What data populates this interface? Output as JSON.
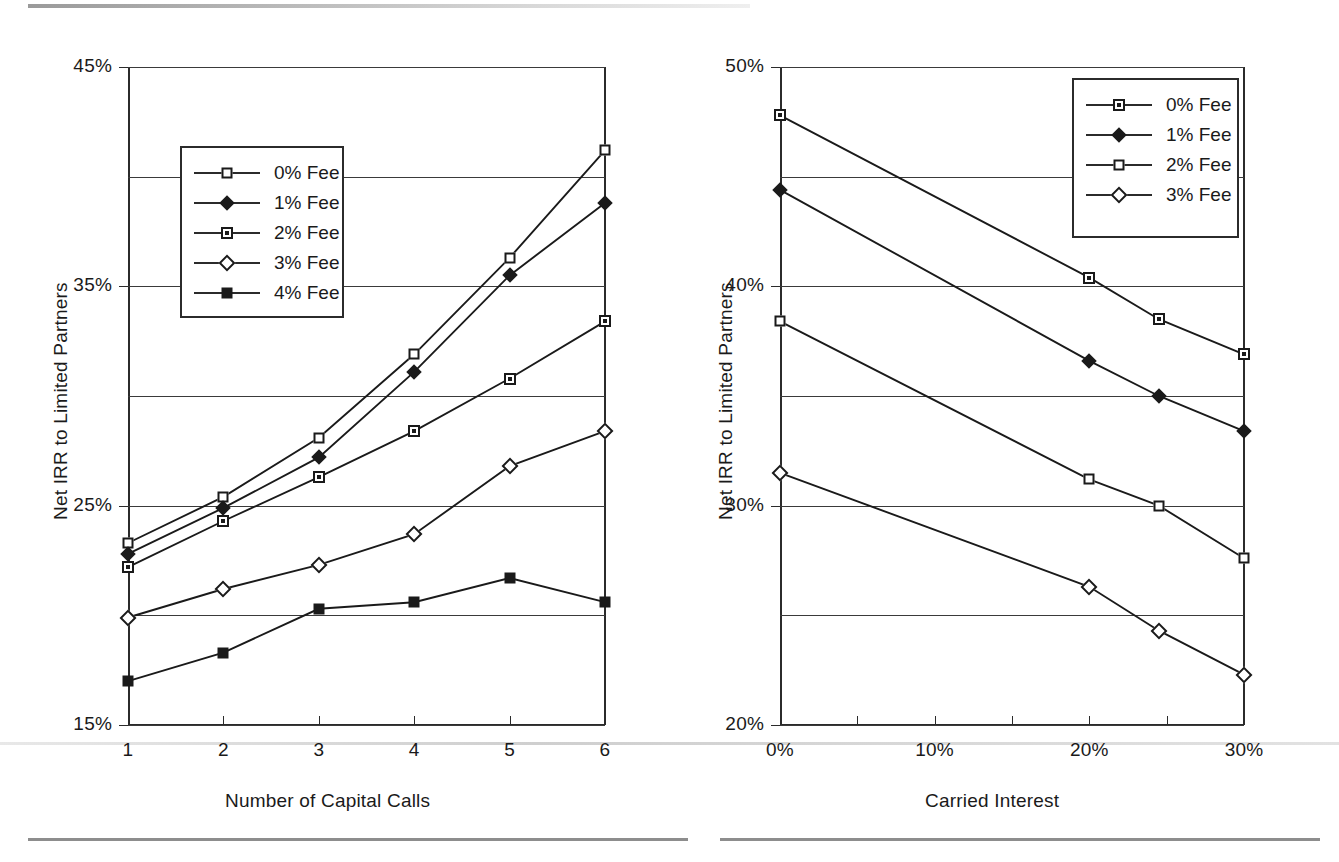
{
  "chart_data": [
    {
      "id": "left",
      "type": "line",
      "title": "",
      "xlabel": "Number of Capital Calls",
      "ylabel": "Net IRR to Limited Partners",
      "x": [
        1,
        2,
        3,
        4,
        5,
        6
      ],
      "xtick_labels": [
        "1",
        "2",
        "3",
        "4",
        "5",
        "6"
      ],
      "ytick_labels": [
        "15%",
        "25%",
        "35%",
        "45%"
      ],
      "ytick_values": [
        15,
        25,
        35,
        45
      ],
      "gridline_values": [
        20,
        30,
        40,
        45
      ],
      "ylim": [
        15,
        45
      ],
      "xlim": [
        1,
        6
      ],
      "grid": true,
      "legend_position": "upper-left-inside",
      "series": [
        {
          "name": "0% Fee",
          "marker": "open-square",
          "values": [
            23.3,
            25.4,
            28.1,
            31.9,
            36.3,
            41.2
          ]
        },
        {
          "name": "1% Fee",
          "marker": "filled-diamond",
          "values": [
            22.8,
            24.9,
            27.2,
            31.1,
            35.5,
            38.8
          ]
        },
        {
          "name": "2% Fee",
          "marker": "dot-square",
          "values": [
            22.2,
            24.3,
            26.3,
            28.4,
            30.8,
            33.4
          ]
        },
        {
          "name": "3% Fee",
          "marker": "open-diamond",
          "values": [
            19.9,
            21.2,
            22.3,
            23.7,
            26.8,
            28.4
          ]
        },
        {
          "name": "4% Fee",
          "marker": "filled-square",
          "values": [
            17.0,
            18.3,
            20.3,
            20.6,
            21.7,
            20.6
          ]
        }
      ]
    },
    {
      "id": "right",
      "type": "line",
      "title": "",
      "xlabel": "Carried Interest",
      "ylabel": "Net IRR to Limited Partners",
      "x": [
        0,
        20,
        24.5,
        30
      ],
      "xtick_labels": [
        "0%",
        "10%",
        "20%",
        "30%"
      ],
      "xtick_values": [
        0,
        10,
        20,
        30
      ],
      "ytick_labels": [
        "20%",
        "30%",
        "40%",
        "50%"
      ],
      "ytick_values": [
        20,
        30,
        40,
        50
      ],
      "gridline_values": [
        25,
        35,
        45,
        50
      ],
      "ylim": [
        20,
        50
      ],
      "xlim": [
        0,
        30
      ],
      "grid": true,
      "legend_position": "upper-right-inside",
      "series": [
        {
          "name": "0% Fee",
          "marker": "dot-square",
          "values": [
            47.8,
            40.4,
            38.5,
            36.9
          ]
        },
        {
          "name": "1% Fee",
          "marker": "filled-diamond",
          "values": [
            44.4,
            36.6,
            35.0,
            33.4
          ]
        },
        {
          "name": "2% Fee",
          "marker": "open-square",
          "values": [
            38.4,
            31.2,
            30.0,
            27.6
          ]
        },
        {
          "name": "3% Fee",
          "marker": "open-diamond",
          "values": [
            31.5,
            26.3,
            24.3,
            22.3
          ]
        }
      ]
    }
  ],
  "left_chart": {
    "ylabel": "Net IRR to Limited Partners",
    "xlabel": "Number of Capital Calls",
    "ytick_labels": [
      "45%",
      "35%",
      "25%",
      "15%"
    ],
    "xtick_labels": [
      "1",
      "2",
      "3",
      "4",
      "5",
      "6"
    ],
    "legend": [
      {
        "label": "0% Fee",
        "marker": "open-square"
      },
      {
        "label": "1% Fee",
        "marker": "filled-diamond"
      },
      {
        "label": "2% Fee",
        "marker": "dot-square"
      },
      {
        "label": "3% Fee",
        "marker": "open-diamond"
      },
      {
        "label": "4% Fee",
        "marker": "filled-square"
      }
    ]
  },
  "right_chart": {
    "ylabel": "Net IRR to Limited Partners",
    "xlabel": "Carried Interest",
    "ytick_labels": [
      "50%",
      "40%",
      "30%",
      "20%"
    ],
    "xtick_labels": [
      "0%",
      "10%",
      "20%",
      "30%"
    ],
    "legend": [
      {
        "label": "0% Fee",
        "marker": "dot-square"
      },
      {
        "label": "1% Fee",
        "marker": "filled-diamond"
      },
      {
        "label": "2% Fee",
        "marker": "open-square"
      },
      {
        "label": "3% Fee",
        "marker": "open-diamond"
      }
    ]
  },
  "colors": {
    "ink": "#1a1a1a",
    "axis": "#2b2b2b",
    "grid": "#3a3a3a",
    "background": "#ffffff"
  }
}
